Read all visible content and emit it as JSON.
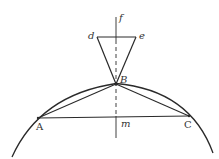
{
  "diagram": {
    "type": "geometric-construction",
    "colors": {
      "line": "#2a2a2a",
      "label": "#333333",
      "background": "#ffffff"
    },
    "points": {
      "A": {
        "label": "A",
        "x": 38,
        "y": 118
      },
      "B": {
        "label": "B",
        "x": 116,
        "y": 84
      },
      "C": {
        "label": "C",
        "x": 189,
        "y": 116
      },
      "d": {
        "label": "d",
        "x": 97,
        "y": 37
      },
      "e": {
        "label": "e",
        "x": 136,
        "y": 37
      },
      "f": {
        "label": "f",
        "x": 116,
        "y": 17
      },
      "m": {
        "label": "m",
        "x": 116,
        "y": 117
      }
    },
    "segments": [
      {
        "name": "AC",
        "from": "A",
        "to": "C"
      },
      {
        "name": "AB",
        "from": "A",
        "to": "B"
      },
      {
        "name": "BC",
        "from": "B",
        "to": "C"
      },
      {
        "name": "de",
        "from": "d",
        "to": "e"
      },
      {
        "name": "dB",
        "from": "d",
        "to": "B"
      },
      {
        "name": "eB",
        "from": "e",
        "to": "B"
      }
    ],
    "axis": {
      "name": "fm-axis",
      "style": "dashed-center",
      "from_y": 17,
      "to_y": 138
    },
    "arc": {
      "name": "circle-arc",
      "through": [
        "A",
        "B",
        "C"
      ]
    }
  }
}
